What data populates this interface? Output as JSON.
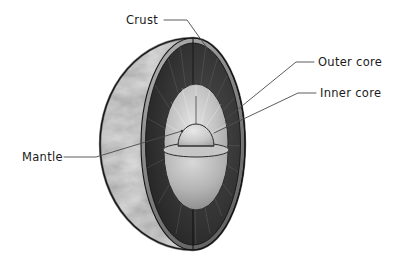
{
  "figure": {
    "background_color": "#ffffff",
    "width": 409,
    "height": 266
  },
  "sphere": {
    "center_x": 193,
    "center_y": 144,
    "radius_x": 93,
    "radius_y": 106,
    "outline_color": "#1a1a1a"
  },
  "layers": [
    {
      "id": "crust",
      "label": "Crust",
      "color": "#6e6e6e",
      "description": "thin outer rim of the cut face"
    },
    {
      "id": "mantle",
      "label": "Mantle",
      "color": "#2e2e2e",
      "description": "dark radially striped wedge between crust and outer core"
    },
    {
      "id": "outer-core",
      "label": "Outer core",
      "color": "#b0b0b0",
      "description": "light grey ellipse at the centre of the cut face"
    },
    {
      "id": "inner-core",
      "label": "Inner core",
      "color": "#c8c8c8",
      "description": "small dome at the middle of the outer core"
    }
  ],
  "callouts": [
    {
      "id": "crust",
      "label": "Crust",
      "text_x": 126,
      "text_y": 24,
      "anchor": "start",
      "leader_points": "164,20 187,20 207,48"
    },
    {
      "id": "outer-core",
      "label": "Outer core",
      "text_x": 318,
      "text_y": 66,
      "anchor": "start",
      "leader_points": "314,62 296,62 226,119"
    },
    {
      "id": "inner-core",
      "label": "Inner core",
      "text_x": 320,
      "text_y": 97,
      "anchor": "start",
      "leader_points": "316,93 298,93 214,133"
    },
    {
      "id": "mantle",
      "label": "Mantle",
      "text_x": 22,
      "text_y": 161,
      "anchor": "start",
      "leader_points": "64,157 96,157 182,131"
    }
  ],
  "surface": {
    "description": "mottled greyscale cloud and continent texture on the visible globe face"
  }
}
